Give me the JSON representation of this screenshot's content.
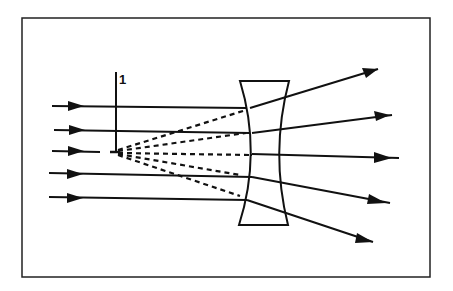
{
  "diagram": {
    "label_1": "1",
    "colors": {
      "ink": "#111111",
      "background": "#ffffff"
    },
    "frame": {
      "x": 22,
      "y": 18,
      "w": 408,
      "h": 259
    },
    "lens": {
      "type": "concave (diverging)",
      "top_y": 81,
      "bottom_y": 225,
      "top_left_x": 240,
      "top_right_x": 289,
      "bottom_left_x": 239,
      "bottom_right_x": 288
    },
    "focal_point": {
      "x": 115,
      "y": 152,
      "label": "1"
    },
    "incoming_rays": [
      {
        "y_start": 106,
        "y_end": 108,
        "x_start": 52,
        "x_end": 247
      },
      {
        "y_start": 130,
        "y_end": 133,
        "x_start": 54,
        "x_end": 250
      },
      {
        "y_start": 151,
        "y_end": 152,
        "x_start": 52,
        "x_end": 100
      },
      {
        "y_start": 173,
        "y_end": 177,
        "x_start": 49,
        "x_end": 252
      },
      {
        "y_start": 197,
        "y_end": 200,
        "x_start": 49,
        "x_end": 247
      }
    ],
    "outgoing_rays": [
      {
        "x1": 250,
        "y1": 108,
        "x2": 378,
        "y2": 69
      },
      {
        "x1": 252,
        "y1": 133,
        "x2": 392,
        "y2": 115
      },
      {
        "x1": 252,
        "y1": 154,
        "x2": 399,
        "y2": 158
      },
      {
        "x1": 252,
        "y1": 177,
        "x2": 390,
        "y2": 203
      },
      {
        "x1": 247,
        "y1": 200,
        "x2": 373,
        "y2": 242
      }
    ],
    "virtual_rays": [
      {
        "x2": 246,
        "y2": 110
      },
      {
        "x2": 246,
        "y2": 133
      },
      {
        "x2": 250,
        "y2": 155
      },
      {
        "x2": 240,
        "y2": 175
      },
      {
        "x2": 240,
        "y2": 196
      }
    ]
  }
}
